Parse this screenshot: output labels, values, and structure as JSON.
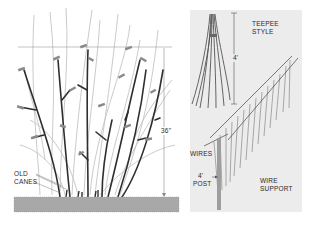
{
  "illustration": {
    "left_panel": {
      "labels": {
        "old_canes": [
          "OLD",
          "CANES"
        ],
        "height": "36\""
      }
    },
    "right_panel": {
      "labels": {
        "teepee": [
          "TEEPEE",
          "STYLE"
        ],
        "teepee_height": "4'",
        "wires": "WIRES",
        "post_height": "4'",
        "post": "POST",
        "wire_support": [
          "WIRE",
          "SUPPORT"
        ]
      }
    }
  },
  "colors": {
    "old_cane": "#2e2e2e",
    "new_cane": "#bdbdbd",
    "leaf_bud": "#8a8a8a",
    "soil": "#a8a8a8",
    "panel_bg": "#ececec",
    "guide_line": "#9a9a9a"
  }
}
